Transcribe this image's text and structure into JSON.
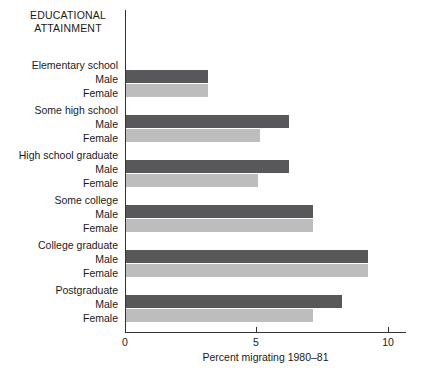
{
  "chart_data": {
    "type": "bar",
    "orientation": "horizontal",
    "title": "EDUCATIONAL ATTAINMENT",
    "title_lines": [
      "EDUCATIONAL",
      "ATTAINMENT"
    ],
    "xlabel": "Percent migrating 1980–81",
    "ylabel": "",
    "xlim": [
      0,
      10.7
    ],
    "xticks": [
      0,
      5,
      10
    ],
    "xtick_labels": [
      "0",
      "5",
      "10"
    ],
    "grid": false,
    "legend": "none",
    "categories": [
      "Elementary school",
      "Some high school",
      "High school graduate",
      "Some college",
      "College graduate",
      "Postgraduate"
    ],
    "series": [
      {
        "name": "Male",
        "color": "#58585a",
        "values": [
          3.1,
          6.2,
          6.2,
          7.1,
          9.2,
          8.2
        ]
      },
      {
        "name": "Female",
        "color": "#bdbdbd",
        "values": [
          3.1,
          5.1,
          5.0,
          7.1,
          9.2,
          7.1
        ]
      }
    ],
    "series_labels": [
      "Male",
      "Female"
    ]
  }
}
